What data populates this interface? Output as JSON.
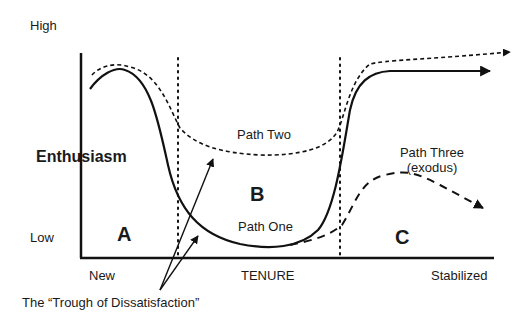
{
  "y_axis": {
    "label": "Enthusiasm",
    "high_label": "High",
    "low_label": "Low"
  },
  "x_axis": {
    "label": "TENURE",
    "start_label": "New",
    "end_label": "Stabilized"
  },
  "regions": [
    {
      "id": "A",
      "label": "A"
    },
    {
      "id": "B",
      "label": "B"
    },
    {
      "id": "C",
      "label": "C"
    }
  ],
  "paths": [
    {
      "name": "Path One",
      "label": "Path One",
      "style": "solid"
    },
    {
      "name": "Path Two",
      "label": "Path Two",
      "style": "short-dashed"
    },
    {
      "name": "Path Three",
      "label": "Path Three",
      "sublabel": "(exodus)",
      "style": "long-dashed"
    }
  ],
  "annotation": {
    "text": "The “Trough of Dissatisfaction”"
  },
  "colors": {
    "line": "#111111",
    "background": "#ffffff"
  }
}
